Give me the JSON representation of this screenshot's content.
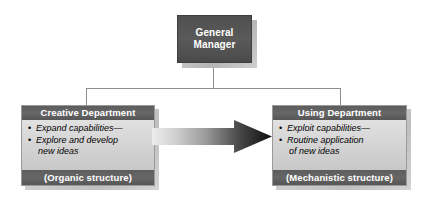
{
  "diagram": {
    "colors": {
      "box_dark": "#5d5d5d",
      "box_light": "#d2d2d2",
      "shadow": "#c3c3c3",
      "connector": "#8e8e8e",
      "text_light": "#ffffff",
      "text_dark": "#000000",
      "arrow_start": "#e6e6e6",
      "arrow_end": "#101010"
    },
    "manager": {
      "line1": "General",
      "line2": "Manager"
    },
    "arrow": {
      "label": "",
      "direction": "left-to-right"
    },
    "departments": [
      {
        "id": "creative",
        "header": "Creative Department",
        "bullets": [
          {
            "line1": "Expand capabilities—",
            "line2": ""
          },
          {
            "line1": "Explore and develop",
            "line2": "new ideas"
          }
        ],
        "footer": "(Organic structure)"
      },
      {
        "id": "using",
        "header": "Using Department",
        "bullets": [
          {
            "line1": "Exploit capabilities—",
            "line2": ""
          },
          {
            "line1": "Routine application",
            "line2": "of new ideas"
          }
        ],
        "footer": "(Mechanistic structure)"
      }
    ]
  }
}
